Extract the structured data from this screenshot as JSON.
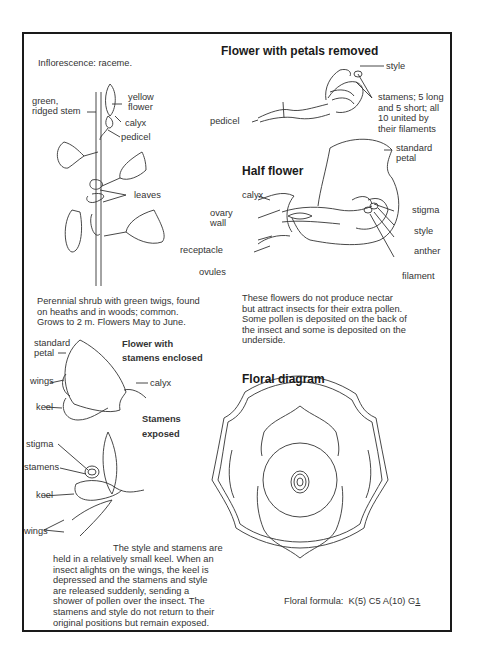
{
  "page": {
    "inflorescence": "Inflorescence: raceme.",
    "plant": {
      "labels": {
        "stem": "green,\nridged stem",
        "flower": "yellow\nflower",
        "calyx": "calyx",
        "pedicel": "pedicel",
        "leaves": "leaves"
      },
      "description": "Perennial shrub with green twigs, found\non heaths and in woods; common.\nGrows to 2 m. Flowers May to June."
    },
    "petals_removed": {
      "title": "Flower with petals removed",
      "labels": {
        "style": "style",
        "stamens": "stamens; 5 long\nand 5 short; all\n10 united by\ntheir filaments",
        "pedicel": "pedicel"
      }
    },
    "half_flower": {
      "title": "Half flower",
      "labels": {
        "standard_petal": "standard\npetal",
        "calyx": "calyx",
        "ovary_wall": "ovary\nwall",
        "receptacle": "receptacle",
        "ovules": "ovules",
        "stigma": "stigma",
        "style": "style",
        "anther": "anther",
        "filament": "filament"
      },
      "description": "These flowers do not produce nectar\nbut attract insects for their extra pollen.\nSome pollen is deposited on the back of\nthe insect and some is deposited on the\nunderside."
    },
    "stamens_enclosed": {
      "title": "Flower with\nstamens enclosed",
      "labels": {
        "standard_petal": "standard\npetal",
        "wings": "wings",
        "keel": "keel",
        "calyx": "calyx"
      }
    },
    "stamens_exposed": {
      "title": "Stamens\nexposed",
      "labels": {
        "stigma": "stigma",
        "stamens": "stamens",
        "keel": "keel",
        "wings": "wings"
      },
      "description_first": "The style and stamens are",
      "description": "held in a relatively small keel. When an\ninsect alights on the wings, the keel is\ndepressed and the stamens and style\nare released suddenly, sending a\nshower of pollen over the insect. The\nstamens and style do not return to their\noriginal positions but remain exposed."
    },
    "floral_diagram": {
      "title": "Floral diagram",
      "formula_label": "Floral formula:",
      "formula": "K(5) C5 A(10) G",
      "formula_gynoecium": "1"
    }
  }
}
